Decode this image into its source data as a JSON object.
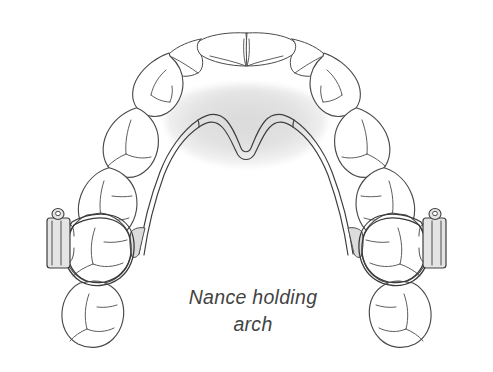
{
  "figure": {
    "title": "Nance holding arch",
    "caption_line1": "Nance holding",
    "caption_line2": "arch",
    "caption_text": "Nance holding\narch",
    "view": "maxillary occlusal view",
    "background_color": "#ffffff",
    "line_color": "#4a4a4a",
    "caption_color": "#434343"
  },
  "appliance": {
    "name": "Nance holding arch",
    "acrylic_button": {
      "label": "palatal acrylic button",
      "fill_color": "#dedede",
      "texture": "horizontal-stripes"
    },
    "palatal_wire": {
      "label": "palatal wire",
      "color": "#3d3d3d",
      "style": "double-line"
    },
    "bands": [
      {
        "side": "left",
        "label": "molar band",
        "tooth": "upper left first molar"
      },
      {
        "side": "right",
        "label": "molar band",
        "tooth": "upper right first molar"
      }
    ],
    "buccal_tubes": [
      {
        "side": "left",
        "label": "buccal tube",
        "fill_color": "#e4e4e4"
      },
      {
        "side": "right",
        "label": "buccal tube",
        "fill_color": "#e4e4e4"
      }
    ],
    "solder_joints": [
      {
        "side": "left",
        "label": "solder joint"
      },
      {
        "side": "right",
        "label": "solder joint"
      }
    ]
  },
  "teeth": {
    "left_quadrant": [
      {
        "name": "central incisor",
        "position": 1
      },
      {
        "name": "lateral incisor",
        "position": 2
      },
      {
        "name": "canine",
        "position": 3
      },
      {
        "name": "first premolar",
        "position": 4
      },
      {
        "name": "second premolar",
        "position": 5
      },
      {
        "name": "first molar",
        "position": 6
      },
      {
        "name": "second molar",
        "position": 7
      }
    ],
    "right_quadrant": [
      {
        "name": "central incisor",
        "position": 1
      },
      {
        "name": "lateral incisor",
        "position": 2
      },
      {
        "name": "canine",
        "position": 3
      },
      {
        "name": "first premolar",
        "position": 4
      },
      {
        "name": "second premolar",
        "position": 5
      },
      {
        "name": "first molar",
        "position": 6
      },
      {
        "name": "second molar",
        "position": 7
      }
    ]
  }
}
